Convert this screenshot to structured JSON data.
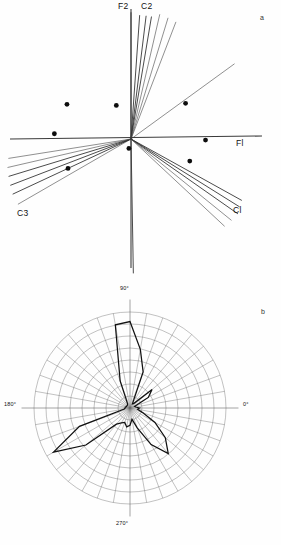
{
  "figure": {
    "panels": [
      {
        "id": "a",
        "letter": "a",
        "type": "vector-biplot"
      },
      {
        "id": "b",
        "letter": "b",
        "type": "rose-diagram"
      }
    ]
  },
  "panel_a": {
    "letter": "a",
    "axis_labels": {
      "x_axis": "Fl",
      "y_axis": "F2",
      "vector_c1": "Cl",
      "vector_c2": "C2",
      "vector_c3": "C3"
    },
    "origin": {
      "x": 131,
      "y": 139
    },
    "axes": {
      "horizontal": {
        "x1": 10,
        "y1": 139,
        "x2": 262,
        "y2": 136
      },
      "vertical": {
        "x1": 131,
        "y1": 9,
        "x2": 131,
        "y2": 268
      }
    }
  },
  "panel_b": {
    "letter": "b",
    "tick_labels": [
      "90°",
      "0°",
      "270°",
      "180°"
    ],
    "label_90": "90°",
    "label_0": "0°",
    "label_270": "270°",
    "label_180": "180°",
    "center": {
      "x": 130,
      "y": 408
    },
    "outer_radius": 96,
    "rings": 8,
    "spokes": 36,
    "spoke_step_deg": 10
  },
  "chart_data": [
    {
      "type": "scatter",
      "title": "",
      "subtitle": "",
      "xlabel": "Fl",
      "ylabel": "F2",
      "grid": false,
      "legend": "none",
      "xlim": [
        -1.0,
        1.0
      ],
      "ylim": [
        -1.0,
        1.0
      ],
      "note": "Panel a: factor-loading vector plot; line vectors radiate from origin, plus isolated sample points.",
      "points": [
        {
          "x": -0.61,
          "y": 0.33
        },
        {
          "x": -0.14,
          "y": 0.32
        },
        {
          "x": 0.52,
          "y": 0.34
        },
        {
          "x": -0.73,
          "y": 0.05
        },
        {
          "x": 0.71,
          "y": -0.01
        },
        {
          "x": -0.02,
          "y": -0.09
        },
        {
          "x": 0.56,
          "y": -0.21
        },
        {
          "x": -0.6,
          "y": -0.28
        }
      ],
      "vectors": [
        {
          "name": "F2",
          "angle_deg": 90.0,
          "length": 0.99,
          "style": "dark"
        },
        {
          "name": "v2",
          "angle_deg": 86.0,
          "length": 0.97,
          "style": "dark"
        },
        {
          "name": "v3",
          "angle_deg": 83.0,
          "length": 0.97,
          "style": "dark"
        },
        {
          "name": "v4",
          "angle_deg": 80.5,
          "length": 0.97,
          "style": "dark"
        },
        {
          "name": "C2",
          "angle_deg": 77.0,
          "length": 1.0,
          "style": "light"
        },
        {
          "name": "v6",
          "angle_deg": 73.0,
          "length": 0.99,
          "style": "light"
        },
        {
          "name": "v7",
          "angle_deg": 69.0,
          "length": 0.98,
          "style": "light"
        },
        {
          "name": "v8",
          "angle_deg": 36.0,
          "length": 1.0,
          "style": "light"
        },
        {
          "name": "C1a",
          "angle_deg": -29.0,
          "length": 0.99,
          "style": "dark"
        },
        {
          "name": "C1b",
          "angle_deg": -32.0,
          "length": 1.0,
          "style": "dark"
        },
        {
          "name": "C1c",
          "angle_deg": -35.0,
          "length": 1.02,
          "style": "dark"
        },
        {
          "name": "C1d",
          "angle_deg": -39.0,
          "length": 1.01,
          "style": "light"
        },
        {
          "name": "C1e",
          "angle_deg": -43.0,
          "length": 1.0,
          "style": "light"
        },
        {
          "name": "down",
          "angle_deg": -89.0,
          "length": 1.05,
          "style": "dark"
        },
        {
          "name": "C3a",
          "angle_deg": -150.0,
          "length": 1.02,
          "style": "light"
        },
        {
          "name": "C3b",
          "angle_deg": -155.0,
          "length": 1.02,
          "style": "dark"
        },
        {
          "name": "C3c",
          "angle_deg": -159.0,
          "length": 1.01,
          "style": "dark"
        },
        {
          "name": "C3d",
          "angle_deg": -163.0,
          "length": 1.0,
          "style": "dark"
        },
        {
          "name": "C3e",
          "angle_deg": -167.0,
          "length": 0.99,
          "style": "light"
        },
        {
          "name": "C3f",
          "angle_deg": -171.0,
          "length": 0.97,
          "style": "light"
        }
      ]
    },
    {
      "type": "line",
      "title": "",
      "xlabel": "",
      "ylabel": "",
      "grid": true,
      "legend": "none",
      "note": "Panel b: polar rose / circular frequency diagram. Radius values are fractions of the outer ring (0-1) at each 10-degree azimuth.",
      "axis_ticks_deg": [
        0,
        90,
        180,
        270
      ],
      "axis_tick_labels": [
        "0°",
        "90°",
        "180°",
        "270°"
      ],
      "rings": 8,
      "radial_max": 1.0,
      "angles_deg": [
        0,
        10,
        20,
        30,
        40,
        50,
        60,
        70,
        80,
        90,
        100,
        110,
        120,
        130,
        140,
        150,
        160,
        170,
        180,
        190,
        200,
        210,
        220,
        230,
        240,
        250,
        260,
        270,
        280,
        290,
        300,
        310,
        320,
        330,
        340,
        350
      ],
      "radii": [
        0.1,
        0.06,
        0.05,
        0.22,
        0.3,
        0.06,
        0.05,
        0.4,
        0.62,
        0.9,
        0.88,
        0.3,
        0.05,
        0.04,
        0.04,
        0.04,
        0.04,
        0.05,
        0.05,
        0.06,
        0.56,
        0.92,
        0.6,
        0.22,
        0.18,
        0.16,
        0.2,
        0.18,
        0.12,
        0.22,
        0.44,
        0.62,
        0.48,
        0.3,
        0.14,
        0.08
      ]
    }
  ]
}
